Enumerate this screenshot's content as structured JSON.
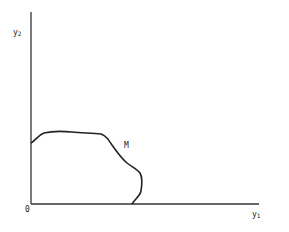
{
  "diagram": {
    "y_axis_label": "y",
    "y_axis_subscript": "2",
    "x_axis_label": "y",
    "x_axis_subscript": "1",
    "origin_label": "0",
    "curve_label": "M",
    "curve_description": "Boundary curve M starting on the y2 axis, bulging outward and ending on the y1 axis",
    "colors": {
      "line": "#222222",
      "background": "#ffffff"
    }
  }
}
